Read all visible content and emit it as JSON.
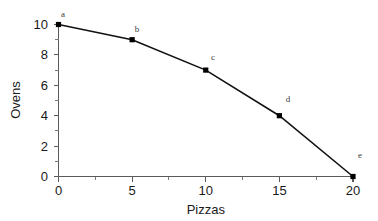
{
  "chart_data": {
    "type": "line",
    "title": "",
    "subtitle": "",
    "xlabel": "Pizzas",
    "ylabel": "Ovens",
    "xlim": [
      0,
      20
    ],
    "ylim": [
      0,
      10
    ],
    "grid": false,
    "legend": false,
    "legend_position": "none",
    "x_ticks": [
      0,
      5,
      10,
      15,
      20
    ],
    "x_tick_labels": [
      "0",
      "5",
      "10",
      "15",
      "20"
    ],
    "x_minor_ticks": [
      2.5,
      7.5,
      12.5,
      17.5
    ],
    "y_ticks": [
      0,
      2,
      4,
      6,
      8,
      10
    ],
    "y_tick_labels": [
      "0",
      "2",
      "4",
      "6",
      "8",
      "10"
    ],
    "y_minor_ticks": [
      1,
      3,
      5,
      7,
      9
    ],
    "marker": "square",
    "marker_color": "#000000",
    "line_color": "#111111",
    "axis_color": "#5a5a5a",
    "background_color": "#ffffff",
    "x": [
      0,
      5,
      10,
      15,
      20
    ],
    "values": [
      10,
      9,
      7,
      4,
      0
    ],
    "point_labels": [
      "a",
      "b",
      "c",
      "d",
      "e"
    ],
    "points": [
      {
        "label": "a",
        "x": 0,
        "y": 10
      },
      {
        "label": "b",
        "x": 5,
        "y": 9
      },
      {
        "label": "c",
        "x": 10,
        "y": 7
      },
      {
        "label": "d",
        "x": 15,
        "y": 4
      },
      {
        "label": "e",
        "x": 20,
        "y": 0
      }
    ],
    "series": [
      {
        "name": "Production possibilities frontier",
        "values": [
          10,
          9,
          7,
          4,
          0
        ]
      }
    ]
  },
  "axes": {
    "x_title": "Pizzas",
    "y_title": "Ovens"
  },
  "x_tick_text": {
    "t0": "0",
    "t1": "5",
    "t2": "10",
    "t3": "15",
    "t4": "20"
  },
  "y_tick_text": {
    "t0": "0",
    "t1": "2",
    "t2": "4",
    "t3": "6",
    "t4": "8",
    "t5": "10"
  },
  "point_text": {
    "a": "a",
    "b": "b",
    "c": "c",
    "d": "d",
    "e": "e"
  }
}
